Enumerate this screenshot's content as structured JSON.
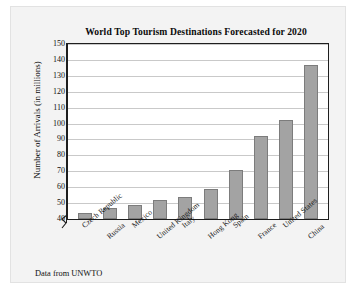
{
  "card": {
    "footnote": "Data from UNWTO"
  },
  "chart_data": {
    "type": "bar",
    "title": "World Top Tourism Destinations Forecasted for 2020",
    "xlabel": "",
    "ylabel": "Number of Arrivals (in millions)",
    "categories": [
      "Czech Republic",
      "Russia",
      "Mexico",
      "United Kingdom",
      "Italy",
      "Hong Kong",
      "Spain",
      "France",
      "United States",
      "China"
    ],
    "values": [
      44,
      47,
      49,
      52,
      54,
      59,
      71,
      92,
      102,
      137
    ],
    "ylim": [
      40,
      150
    ],
    "ytick_step": 10,
    "yticks": [
      40,
      50,
      60,
      70,
      80,
      90,
      100,
      110,
      120,
      130,
      140,
      150
    ],
    "ytick_labels": [
      "40",
      "50",
      "60",
      "70",
      "80",
      "90",
      "100",
      "110",
      "120",
      "130",
      "140",
      "150"
    ],
    "grid": true,
    "axis_break": true,
    "legend": "none",
    "bar_color": "#a3a3a3",
    "bar_edge_color": "#7c7c7c",
    "grid_color": "#c9c9c9",
    "axis_color": "#1e1e1e",
    "background": "#ffffff",
    "panel_background": "#f3f3f3"
  }
}
